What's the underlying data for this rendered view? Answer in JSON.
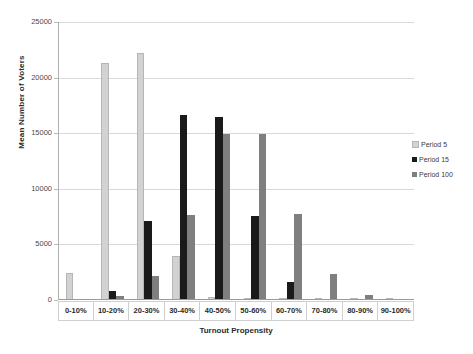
{
  "chart_data": {
    "type": "bar",
    "title": "",
    "xlabel": "Turnout Propensity",
    "ylabel": "Mean Number of Voters",
    "categories": [
      "0-10%",
      "10-20%",
      "20-30%",
      "30-40%",
      "40-50%",
      "50-60%",
      "60-70%",
      "70-80%",
      "80-90%",
      "90-100%"
    ],
    "series": [
      {
        "name": "Period 5",
        "color": "#d2d2d2",
        "values": [
          2400,
          21300,
          22250,
          3950,
          250,
          0,
          0,
          50,
          0,
          0
        ]
      },
      {
        "name": "Period 15",
        "color": "#1a1a1a",
        "values": [
          30,
          800,
          7150,
          16600,
          16450,
          7550,
          1600,
          100,
          0,
          0
        ]
      },
      {
        "name": "Period 100",
        "color": "#7f7f7f",
        "values": [
          0,
          380,
          2200,
          7650,
          14900,
          14950,
          7750,
          2300,
          450,
          80
        ]
      }
    ],
    "ylim": [
      0,
      25000
    ],
    "yticks": [
      0,
      5000,
      10000,
      15000,
      20000,
      25000
    ],
    "ytick_labels": [
      "0",
      "5000",
      "10000",
      "15000",
      "20000",
      "25000"
    ],
    "grid": true,
    "legend_position": "right"
  },
  "legend": {
    "items": [
      {
        "label": "Period 5",
        "color": "#d2d2d2"
      },
      {
        "label": "Period 15",
        "color": "#1a1a1a"
      },
      {
        "label": "Period 100",
        "color": "#7f7f7f"
      }
    ]
  },
  "axes": {
    "y_title": "Mean Number of Voters",
    "x_title": "Turnout Propensity"
  }
}
